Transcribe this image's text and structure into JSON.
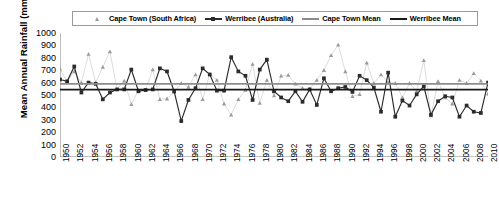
{
  "legend": {
    "items": [
      {
        "label": "Cape Town (South Africa)",
        "marker": "triangle-marker",
        "color": "#9b9b9b",
        "line": false
      },
      {
        "label": "Werribee (Australia)",
        "marker": "square-marker",
        "color": "#2b2b2b",
        "line": true
      },
      {
        "label": "Cape Town Mean",
        "marker": "line-swatch",
        "color": "#8c8c8c",
        "line": true
      },
      {
        "label": "Werribee Mean",
        "marker": "line-swatch",
        "color": "#1a1a1a",
        "line": true
      }
    ]
  },
  "axes": {
    "ylabel": "Mean Annual Rainfall (mm)",
    "yticks": [
      "1000",
      "900",
      "800",
      "700",
      "600",
      "500",
      "400",
      "300",
      "200",
      "100",
      "0"
    ],
    "xticks": [
      "1950",
      "1952",
      "1954",
      "1956",
      "1958",
      "1960",
      "1962",
      "1964",
      "1966",
      "1968",
      "1970",
      "1972",
      "1974",
      "1976",
      "1978",
      "1980",
      "1982",
      "1984",
      "1986",
      "1988",
      "1990",
      "1992",
      "1994",
      "1996",
      "1998",
      "2000",
      "2002",
      "2004",
      "2006",
      "2008",
      "2010"
    ]
  },
  "chart_data": {
    "type": "line",
    "title": "",
    "xlabel": "",
    "ylabel": "Mean Annual Rainfall (mm)",
    "ylim": [
      0,
      1000
    ],
    "xlim": [
      1950,
      2010
    ],
    "ytick_step": 100,
    "xtick_step": 2,
    "grid": false,
    "legend_position": "top",
    "x": [
      1950,
      1951,
      1952,
      1953,
      1954,
      1955,
      1956,
      1957,
      1958,
      1959,
      1960,
      1961,
      1962,
      1963,
      1964,
      1965,
      1966,
      1967,
      1968,
      1969,
      1970,
      1971,
      1972,
      1973,
      1974,
      1975,
      1976,
      1977,
      1978,
      1979,
      1980,
      1981,
      1982,
      1983,
      1984,
      1985,
      1986,
      1987,
      1988,
      1989,
      1990,
      1991,
      1992,
      1993,
      1994,
      1995,
      1996,
      1997,
      1998,
      1999,
      2000,
      2001,
      2002,
      2003,
      2004,
      2005,
      2006,
      2007,
      2008,
      2009,
      2010
    ],
    "series": [
      {
        "name": "Cape Town (South Africa)",
        "marker": "triangle",
        "color": "#9b9b9b",
        "line_style": "thin-light",
        "values": [
          710,
          605,
          690,
          600,
          830,
          600,
          725,
          850,
          545,
          615,
          425,
          540,
          540,
          705,
          465,
          470,
          525,
          595,
          565,
          665,
          465,
          670,
          620,
          430,
          340,
          465,
          540,
          750,
          435,
          620,
          495,
          655,
          660,
          590,
          555,
          550,
          620,
          700,
          820,
          905,
          690,
          490,
          505,
          760,
          595,
          665,
          600,
          595,
          480,
          595,
          530,
          780,
          335,
          610,
          480,
          430,
          620,
          595,
          675,
          615,
          510
        ]
      },
      {
        "name": "Werribee (Australia)",
        "marker": "square",
        "color": "#2b2b2b",
        "line_style": "solid",
        "values": [
          625,
          610,
          730,
          520,
          600,
          590,
          465,
          520,
          545,
          545,
          705,
          530,
          540,
          545,
          715,
          690,
          530,
          290,
          460,
          555,
          715,
          665,
          535,
          535,
          805,
          690,
          655,
          460,
          705,
          785,
          530,
          480,
          450,
          530,
          445,
          545,
          420,
          635,
          530,
          555,
          565,
          525,
          655,
          620,
          560,
          365,
          680,
          325,
          455,
          415,
          505,
          570,
          340,
          450,
          490,
          480,
          325,
          415,
          365,
          355,
          600
        ]
      }
    ],
    "mean_lines": [
      {
        "name": "Cape Town Mean",
        "value": 590,
        "color": "#8c8c8c"
      },
      {
        "name": "Werribee Mean",
        "value": 543,
        "color": "#1a1a1a"
      }
    ]
  }
}
